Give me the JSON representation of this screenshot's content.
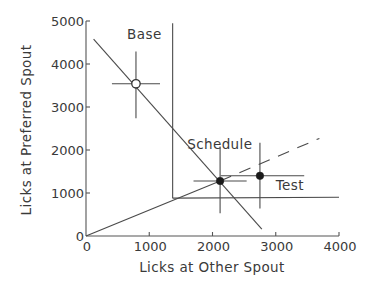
{
  "chart_data": {
    "type": "scatter",
    "title": "",
    "xlabel": "Licks at Other Spout",
    "ylabel": "Licks at Preferred Spout",
    "xlim": [
      0,
      4000
    ],
    "ylim": [
      0,
      5000
    ],
    "xticks": [
      0,
      1000,
      2000,
      3000,
      4000
    ],
    "yticks": [
      0,
      1000,
      2000,
      3000,
      4000,
      5000
    ],
    "xtick_labels": [
      "0",
      "1000",
      "2000",
      "3000",
      "4000"
    ],
    "ytick_labels": [
      "0",
      "1000",
      "2000",
      "3000",
      "4000",
      "5000"
    ],
    "grid": false,
    "legend": null,
    "points": [
      {
        "name": "Base",
        "x": 790,
        "y": 3540,
        "marker": "open-circle",
        "x_err": [
          380,
          380
        ],
        "y_err": [
          800,
          750
        ]
      },
      {
        "name": "Schedule",
        "x": 2120,
        "y": 1280,
        "marker": "filled-circle",
        "x_err": [
          420,
          420
        ],
        "y_err": [
          750,
          800
        ]
      },
      {
        "name": "Test",
        "x": 2750,
        "y": 1400,
        "marker": "filled-circle",
        "x_err": [
          620,
          700
        ],
        "y_err": [
          760,
          770
        ]
      }
    ],
    "lines": [
      {
        "name": "constraint-line",
        "style": "solid",
        "points": [
          [
            120,
            4580
          ],
          [
            2780,
            160
          ]
        ]
      },
      {
        "name": "schedule-ratio-line",
        "style": "solid",
        "points": [
          [
            0,
            0
          ],
          [
            2120,
            1280
          ]
        ]
      },
      {
        "name": "schedule-ratio-extension",
        "style": "dashed",
        "points": [
          [
            2120,
            1280
          ],
          [
            3690,
            2270
          ]
        ]
      },
      {
        "name": "vertical-threshold-line",
        "style": "solid",
        "points": [
          [
            1370,
            4950
          ],
          [
            1370,
            880
          ]
        ]
      },
      {
        "name": "horizontal-threshold-line",
        "style": "solid",
        "points": [
          [
            1370,
            880
          ],
          [
            4000,
            900
          ]
        ]
      }
    ],
    "annotations": [
      {
        "text": "Base",
        "x": 650,
        "y": 4580
      },
      {
        "text": "Schedule",
        "x": 1600,
        "y": 2020
      },
      {
        "text": "Test",
        "x": 3000,
        "y": 1060
      }
    ]
  }
}
